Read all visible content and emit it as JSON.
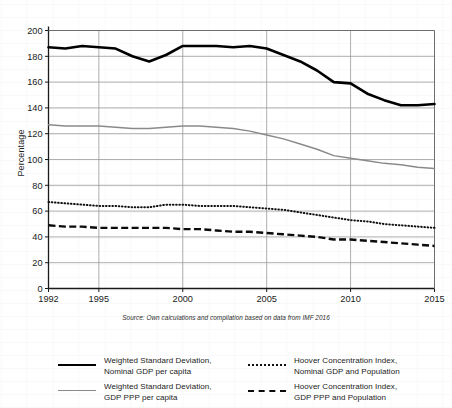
{
  "chart_data": {
    "type": "line",
    "title": "",
    "xlabel": "",
    "ylabel": "Percentage",
    "xlim": [
      1992,
      2015
    ],
    "ylim": [
      0,
      200
    ],
    "ytick_step": 20,
    "yticks": [
      0,
      20,
      40,
      60,
      80,
      100,
      120,
      140,
      160,
      180,
      200
    ],
    "xticks": [
      1992,
      1995,
      2000,
      2005,
      2010,
      2015
    ],
    "xtick_labels": [
      "1992",
      "1995",
      "2000",
      "2005",
      "2010",
      "2015"
    ],
    "ytick_labels": [
      "0",
      "20",
      "40",
      "60",
      "80",
      "100",
      "120",
      "140",
      "160",
      "180",
      "200"
    ],
    "grid": true,
    "grid_color": "#9a9a9a",
    "legend_position": "bottom",
    "x": [
      1992,
      1993,
      1994,
      1995,
      1996,
      1997,
      1998,
      1999,
      2000,
      2001,
      2002,
      2003,
      2004,
      2005,
      2006,
      2007,
      2008,
      2009,
      2010,
      2011,
      2012,
      2013,
      2014,
      2015
    ],
    "series": [
      {
        "name": "Weighted Standard Deviation, Nominal GDP per capita",
        "style": "solid-thick",
        "color": "#000000",
        "values": [
          187,
          186,
          188,
          187,
          186,
          180,
          176,
          181,
          188,
          188,
          188,
          187,
          188,
          186,
          181,
          176,
          169,
          160,
          159,
          151,
          146,
          142,
          142,
          143
        ]
      },
      {
        "name": "Weighted Standard Deviation, GDP PPP per capita",
        "style": "solid-gray",
        "color": "#8a8a8a",
        "values": [
          127,
          126,
          126,
          126,
          125,
          124,
          124,
          125,
          126,
          126,
          125,
          124,
          122,
          119,
          116,
          112,
          108,
          103,
          101,
          99,
          97,
          96,
          94,
          93
        ]
      },
      {
        "name": "Hoover Concentration Index, Nominal GDP and Population",
        "style": "dotted",
        "color": "#111111",
        "values": [
          67,
          66,
          65,
          64,
          64,
          63,
          63,
          65,
          65,
          64,
          64,
          64,
          63,
          62,
          61,
          59,
          57,
          55,
          53,
          52,
          50,
          49,
          48,
          47
        ]
      },
      {
        "name": "Hoover Concentration Index, GDP PPP and Population",
        "style": "dashed",
        "color": "#0b0b0b",
        "values": [
          49,
          48,
          48,
          47,
          47,
          47,
          47,
          47,
          46,
          46,
          45,
          44,
          44,
          43,
          42,
          41,
          40,
          38,
          38,
          37,
          36,
          35,
          34,
          33
        ]
      }
    ]
  },
  "y_axis": {
    "title": "Percentage"
  },
  "source": {
    "note": "Source: Own calculations and compilation based on data from IMF 2016"
  },
  "legend": {
    "items": [
      {
        "line1": "Weighted Standard Deviation,",
        "line2": "Nominal GDP per capita",
        "style": "solid-thick"
      },
      {
        "line1": "Hoover Concentration Index,",
        "line2": "Nominal GDP and Population",
        "style": "dotted"
      },
      {
        "line1": "Weighted Standard Deviation,",
        "line2": "GDP PPP per capita",
        "style": "solid-gray"
      },
      {
        "line1": "Hoover Concentration Index,",
        "line2": "GDP PPP and Population",
        "style": "dashed"
      }
    ]
  }
}
